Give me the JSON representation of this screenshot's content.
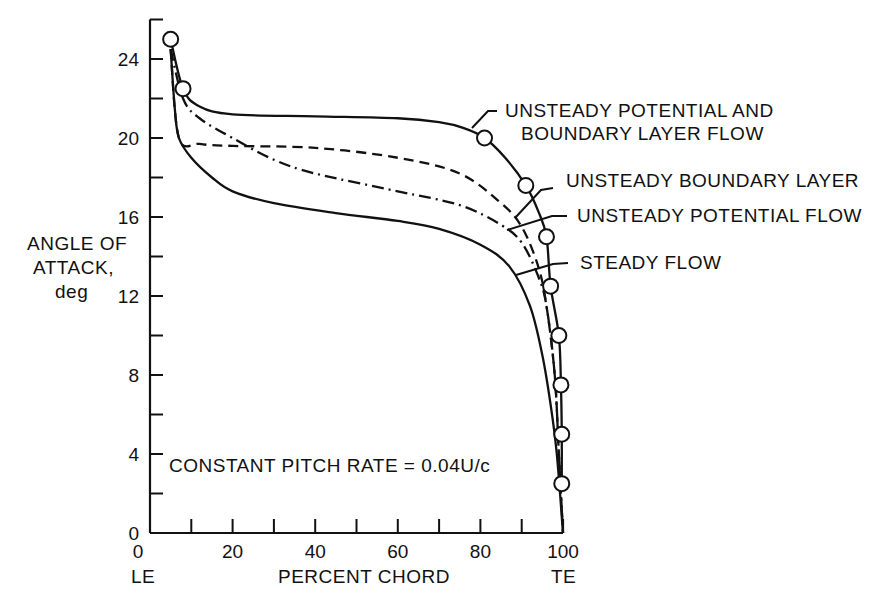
{
  "chart_data": {
    "type": "line",
    "title": "",
    "xlabel": "PERCENT CHORD",
    "ylabel": [
      "ANGLE OF",
      "ATTACK,",
      "deg"
    ],
    "xlim": [
      0,
      100
    ],
    "ylim": [
      0,
      26
    ],
    "x_ticks": [
      0,
      20,
      40,
      60,
      80,
      100
    ],
    "x_minor_ticks": [
      10,
      30,
      50,
      70,
      90
    ],
    "y_ticks": [
      0,
      4,
      8,
      12,
      16,
      20,
      24
    ],
    "y_minor_ticks": [
      2,
      6,
      10,
      14,
      18,
      22,
      26
    ],
    "x_end_labels": {
      "left": "LE",
      "right": "TE"
    },
    "grid": false,
    "annotation": "CONSTANT PITCH RATE = 0.04U/c",
    "series": [
      {
        "name": "UNSTEADY POTENTIAL AND BOUNDARY LAYER FLOW",
        "style": "solid",
        "markers": "open-circle",
        "x": [
          5,
          8,
          12,
          20,
          40,
          60,
          70,
          76,
          81,
          86,
          91,
          94,
          96,
          97,
          99,
          99.5,
          99.7,
          99.7
        ],
        "y": [
          25,
          22.5,
          21.6,
          21.2,
          21.1,
          21.0,
          20.8,
          20.5,
          20.0,
          19.0,
          17.6,
          16.3,
          15.0,
          12.5,
          10.0,
          7.5,
          5.0,
          2.5
        ],
        "marker_points": [
          [
            5,
            25
          ],
          [
            8,
            22.5
          ],
          [
            81,
            20
          ],
          [
            91,
            17.6
          ],
          [
            96,
            15
          ],
          [
            97,
            12.5
          ],
          [
            99,
            10
          ],
          [
            99.5,
            7.5
          ],
          [
            99.7,
            5
          ],
          [
            99.7,
            2.5
          ]
        ]
      },
      {
        "name": "UNSTEADY BOUNDARY LAYER",
        "style": "dashed",
        "x": [
          5,
          7,
          12,
          20,
          40,
          60,
          75,
          85,
          90,
          94,
          96,
          98,
          99,
          100
        ],
        "y": [
          24.5,
          20.0,
          19.7,
          19.6,
          19.5,
          19.0,
          18.2,
          16.7,
          15.5,
          13.5,
          11.5,
          8.0,
          4.0,
          0.0
        ]
      },
      {
        "name": "UNSTEADY POTENTIAL FLOW",
        "style": "dash-dot",
        "x": [
          5,
          8,
          12,
          20,
          30,
          40,
          60,
          75,
          85,
          90,
          94,
          96,
          98,
          99,
          100
        ],
        "y": [
          24.5,
          22.0,
          21.0,
          20.0,
          18.9,
          18.2,
          17.3,
          16.6,
          15.6,
          14.7,
          13.0,
          11.5,
          8.0,
          4.0,
          0.0
        ]
      },
      {
        "name": "STEADY FLOW",
        "style": "solid",
        "x": [
          5,
          6,
          7,
          10,
          15,
          20,
          30,
          45,
          60,
          70,
          80,
          87,
          92,
          95,
          97,
          98.5,
          100
        ],
        "y": [
          24.5,
          21.5,
          20.0,
          19.0,
          18.0,
          17.3,
          16.7,
          16.2,
          15.8,
          15.4,
          14.6,
          13.5,
          11.5,
          9.0,
          6.5,
          4.0,
          0.0
        ]
      }
    ],
    "legend_callouts": [
      {
        "text_lines": [
          "UNSTEADY POTENTIAL AND",
          "BOUNDARY LAYER FLOW"
        ],
        "series": 0
      },
      {
        "text_lines": [
          "UNSTEADY BOUNDARY LAYER"
        ],
        "series": 1
      },
      {
        "text_lines": [
          "UNSTEADY POTENTIAL FLOW"
        ],
        "series": 2
      },
      {
        "text_lines": [
          "STEADY FLOW"
        ],
        "series": 3
      }
    ]
  },
  "labels": {
    "y_title_1": "ANGLE OF",
    "y_title_2": "ATTACK,",
    "y_title_3": "deg",
    "x_title": "PERCENT CHORD",
    "le": "LE",
    "te": "TE",
    "annotation": "CONSTANT PITCH RATE = 0.04U/c",
    "callout_0a": "UNSTEADY POTENTIAL AND",
    "callout_0b": "BOUNDARY LAYER FLOW",
    "callout_1": "UNSTEADY BOUNDARY LAYER",
    "callout_2": "UNSTEADY POTENTIAL FLOW",
    "callout_3": "STEADY FLOW"
  },
  "colors": {
    "ink": "#111111",
    "background": "#ffffff"
  }
}
